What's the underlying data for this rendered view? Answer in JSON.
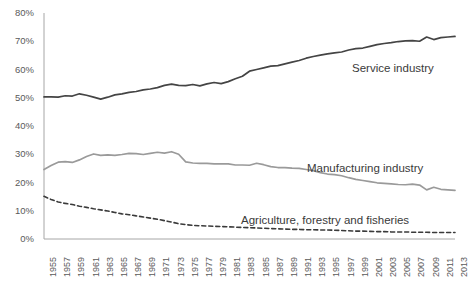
{
  "chart_data": {
    "type": "line",
    "title": "",
    "xlabel": "",
    "ylabel": "",
    "ylim": [
      0,
      80
    ],
    "ytick_labels": [
      "0%",
      "10%",
      "20%",
      "30%",
      "40%",
      "50%",
      "60%",
      "70%",
      "80%"
    ],
    "ytick_values": [
      0,
      10,
      20,
      30,
      40,
      50,
      60,
      70,
      80
    ],
    "grid": false,
    "legend_position": "inline-right",
    "x": [
      1955,
      1956,
      1957,
      1958,
      1959,
      1960,
      1961,
      1962,
      1963,
      1964,
      1965,
      1966,
      1967,
      1968,
      1969,
      1970,
      1971,
      1972,
      1973,
      1974,
      1975,
      1976,
      1977,
      1978,
      1979,
      1980,
      1981,
      1982,
      1983,
      1984,
      1985,
      1986,
      1987,
      1988,
      1989,
      1990,
      1991,
      1992,
      1993,
      1994,
      1995,
      1996,
      1997,
      1998,
      1999,
      2000,
      2001,
      2002,
      2003,
      2004,
      2005,
      2006,
      2007,
      2008,
      2009,
      2010,
      2011,
      2012,
      2013
    ],
    "xtick_labels": [
      "1955",
      "1957",
      "1959",
      "1961",
      "1963",
      "1965",
      "1967",
      "1969",
      "1971",
      "1973",
      "1975",
      "1977",
      "1979",
      "1981",
      "1983",
      "1985",
      "1987",
      "1989",
      "1991",
      "1993",
      "1995",
      "1997",
      "1999",
      "2001",
      "2003",
      "2005",
      "2007",
      "2009",
      "2011",
      "2013"
    ],
    "series": [
      {
        "name": "Service industry",
        "color": "#444444",
        "style": "solid",
        "values": [
          50.3,
          50.3,
          50.2,
          50.7,
          50.6,
          51.4,
          50.9,
          50.2,
          49.5,
          50.2,
          51.0,
          51.4,
          51.9,
          52.2,
          52.8,
          53.1,
          53.6,
          54.4,
          54.8,
          54.4,
          54.3,
          54.7,
          54.2,
          54.9,
          55.4,
          55.0,
          55.7,
          56.7,
          57.6,
          59.4,
          60.0,
          60.6,
          61.2,
          61.4,
          62.0,
          62.6,
          63.2,
          64.0,
          64.6,
          65.1,
          65.5,
          65.9,
          66.2,
          66.9,
          67.4,
          67.6,
          68.2,
          68.8,
          69.2,
          69.5,
          69.9,
          70.1,
          70.2,
          70.0,
          71.5,
          70.6,
          71.3,
          71.5,
          71.7
        ]
      },
      {
        "name": "Manufacturing industry",
        "color": "#9a9a9a",
        "style": "solid",
        "values": [
          24.6,
          26.0,
          27.2,
          27.4,
          27.1,
          28.0,
          29.2,
          30.1,
          29.6,
          29.8,
          29.6,
          29.9,
          30.3,
          30.2,
          29.9,
          30.3,
          30.7,
          30.4,
          30.9,
          30.0,
          27.3,
          26.9,
          26.8,
          26.8,
          26.6,
          26.6,
          26.6,
          26.2,
          26.2,
          26.1,
          26.8,
          26.3,
          25.6,
          25.3,
          25.3,
          25.1,
          25.0,
          24.6,
          24.2,
          23.5,
          23.0,
          22.8,
          22.4,
          21.7,
          21.1,
          20.7,
          20.3,
          19.9,
          19.7,
          19.5,
          19.3,
          19.2,
          19.4,
          19.1,
          17.4,
          18.3,
          17.6,
          17.4,
          17.2
        ]
      },
      {
        "name": "Agriculture, forestry and fisheries",
        "color": "#3a3a3a",
        "style": "dashed",
        "values": [
          15.1,
          14.0,
          13.1,
          12.6,
          12.2,
          11.6,
          11.2,
          10.7,
          10.3,
          9.9,
          9.4,
          8.9,
          8.6,
          8.2,
          7.8,
          7.4,
          7.0,
          6.5,
          6.0,
          5.4,
          5.1,
          4.8,
          4.7,
          4.6,
          4.5,
          4.4,
          4.3,
          4.2,
          4.1,
          4.0,
          3.9,
          3.8,
          3.7,
          3.6,
          3.5,
          3.4,
          3.4,
          3.3,
          3.3,
          3.2,
          3.2,
          3.1,
          3.0,
          2.9,
          2.8,
          2.8,
          2.7,
          2.6,
          2.6,
          2.5,
          2.5,
          2.5,
          2.4,
          2.4,
          2.4,
          2.3,
          2.3,
          2.3,
          2.3
        ]
      }
    ],
    "annotations": [
      {
        "text": "Service industry",
        "x_px": 352,
        "y_px": 62
      },
      {
        "text": "Manufacturing industry",
        "x_px": 307,
        "y_px": 162
      },
      {
        "text": "Agriculture, forestry and fisheries",
        "x_px": 241,
        "y_px": 214
      }
    ]
  },
  "colors": {
    "background": "#ffffff",
    "axis": "#a6a6a6",
    "tick_text": "#5a5a5a",
    "service": "#444444",
    "manufacturing": "#9a9a9a",
    "agriculture": "#3a3a3a"
  }
}
